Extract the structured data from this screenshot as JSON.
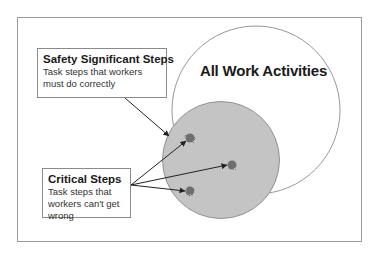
{
  "diagram": {
    "outer_set": {
      "label": "All Work Activities"
    },
    "callouts": [
      {
        "title": "Safety Significant Steps",
        "description": "Task steps that workers must do correctly"
      },
      {
        "title": "Critical Steps",
        "description": "Task steps that workers can't get wrong"
      }
    ],
    "colors": {
      "outer_circle_stroke": "#8c8c8c",
      "inner_circle_fill": "#c4c4c4",
      "inner_circle_stroke": "#8a8a8a",
      "critical_point_fill": "#6e6e6e",
      "arrow_color": "#222222"
    }
  }
}
